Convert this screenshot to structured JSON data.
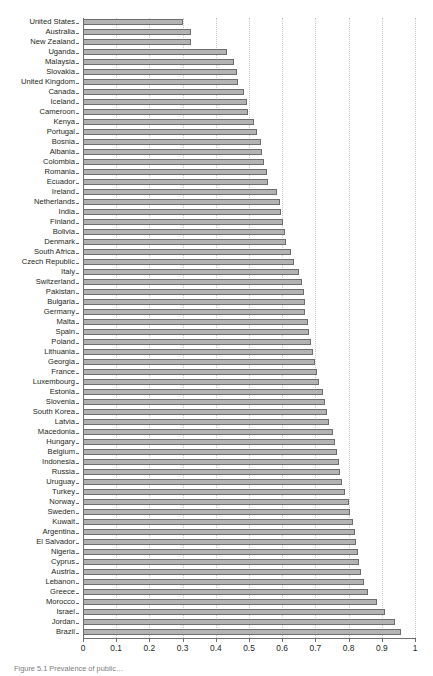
{
  "figure": {
    "caption": "Figure 5.1 Prevalence of public…",
    "header_faint": ""
  },
  "chart_data": {
    "type": "bar",
    "orientation": "horizontal",
    "title": "",
    "xlabel": "",
    "ylabel": "",
    "xlim": [
      0,
      1
    ],
    "xticks": [
      0,
      0.1,
      0.2,
      0.3,
      0.4,
      0.5,
      0.6,
      0.7,
      0.8,
      0.9,
      1
    ],
    "xtick_labels": [
      "0",
      "0.1",
      "0.2",
      "0.3",
      "0.4",
      "0.5",
      "0.6",
      "0.7",
      "0.8",
      "0.9",
      "1"
    ],
    "grid": "vertical-dotted",
    "legend": null,
    "bar_color": "#b3b3b3",
    "bar_edge_color": "#6d6d6d",
    "categories": [
      "United States",
      "Australia",
      "New Zealand",
      "Uganda",
      "Malaysia",
      "Slovakia",
      "United Kingdom",
      "Canada",
      "Iceland",
      "Cameroon",
      "Kenya",
      "Portugal",
      "Bosnia",
      "Albania",
      "Colombia",
      "Romania",
      "Ecuador",
      "Ireland",
      "Netherlands",
      "India",
      "Finland",
      "Bolivia",
      "Denmark",
      "South Africa",
      "Czech Republic",
      "Italy",
      "Switzerland",
      "Pakistan",
      "Bulgaria",
      "Germany",
      "Malta",
      "Spain",
      "Poland",
      "Lithuania",
      "Georgia",
      "France",
      "Luxembourg",
      "Estonia",
      "Slovenia",
      "South Korea",
      "Latvia",
      "Macedonia",
      "Hungary",
      "Belgium",
      "Indonesia",
      "Russia",
      "Uruguay",
      "Turkey",
      "Norway",
      "Sweden",
      "Kuwait",
      "Argentina",
      "El Salvador",
      "Nigeria",
      "Cyprus",
      "Austria",
      "Lebanon",
      "Greece",
      "Morocco",
      "Israel",
      "Jordan",
      "Brazil"
    ],
    "values": [
      0.3,
      0.325,
      0.325,
      0.435,
      0.455,
      0.465,
      0.468,
      0.485,
      0.495,
      0.498,
      0.515,
      0.525,
      0.535,
      0.538,
      0.545,
      0.555,
      0.558,
      0.585,
      0.592,
      0.597,
      0.603,
      0.607,
      0.61,
      0.628,
      0.637,
      0.65,
      0.66,
      0.665,
      0.668,
      0.67,
      0.678,
      0.682,
      0.688,
      0.692,
      0.7,
      0.705,
      0.712,
      0.722,
      0.728,
      0.735,
      0.742,
      0.752,
      0.76,
      0.765,
      0.77,
      0.775,
      0.78,
      0.788,
      0.8,
      0.805,
      0.812,
      0.818,
      0.822,
      0.828,
      0.832,
      0.838,
      0.845,
      0.858,
      0.885,
      0.91,
      0.94,
      0.958
    ]
  }
}
